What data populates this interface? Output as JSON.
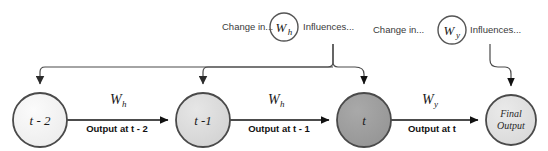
{
  "diagram": {
    "background": "#ffffff",
    "nodes": [
      {
        "id": "t-2",
        "label": "t - 2",
        "cx": 40,
        "cy": 120,
        "r": 27,
        "fill": "#f2f2f2",
        "stroke": "#4a4a4a",
        "font_size": 13
      },
      {
        "id": "t-1",
        "label": "t -1",
        "cx": 203,
        "cy": 120,
        "r": 27,
        "fill": "#dddddd",
        "stroke": "#4a4a4a",
        "font_size": 13
      },
      {
        "id": "t",
        "label": "t",
        "cx": 364,
        "cy": 120,
        "r": 27,
        "fill": "#9d9d9d",
        "stroke": "#4a4a4a",
        "font_size": 13
      },
      {
        "id": "final",
        "label_line1": "Final",
        "label_line2": "Output",
        "cx": 511,
        "cy": 120,
        "r": 25,
        "fill": "#e0e0e0",
        "stroke": "#4a4a4a"
      }
    ],
    "weight_nodes": [
      {
        "id": "Wh",
        "label": "W",
        "subscript": "h",
        "cx": 284,
        "cy": 27,
        "r": 14,
        "fill": "#ffffff",
        "stroke": "#555555"
      },
      {
        "id": "Wy",
        "label": "W",
        "subscript": "y",
        "cx": 452,
        "cy": 30,
        "r": 14,
        "fill": "#ffffff",
        "stroke": "#555555"
      }
    ],
    "edges": [
      {
        "id": "e1",
        "from": "t-2",
        "to": "t-1",
        "weight": "W",
        "weight_sub": "h",
        "output_label": "Output at t - 2"
      },
      {
        "id": "e2",
        "from": "t-1",
        "to": "t",
        "weight": "W",
        "weight_sub": "h",
        "output_label": "Output at t - 1"
      },
      {
        "id": "e3",
        "from": "t",
        "to": "final",
        "weight": "W",
        "weight_sub": "y",
        "output_label": "Output at t"
      }
    ],
    "annotations": [
      {
        "id": "change-in-wh",
        "text": "Change in...",
        "x": 222,
        "y": 30
      },
      {
        "id": "influences-wh",
        "text": "Influences...",
        "x": 303,
        "y": 30
      },
      {
        "id": "change-in-wy",
        "text": "Change in...",
        "x": 373,
        "y": 33
      },
      {
        "id": "influences-wy",
        "text": "Influences...",
        "x": 470,
        "y": 33
      }
    ],
    "colors": {
      "line": "#4a4a4a",
      "arrow": "#111111",
      "text": "#1a1a1a",
      "annotation_text": "#3a3a3a"
    }
  }
}
